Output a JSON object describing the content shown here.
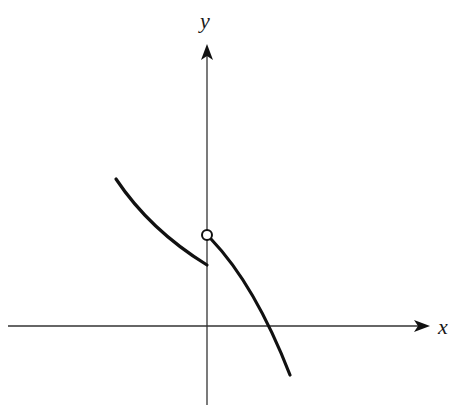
{
  "figure": {
    "type": "piecewise function graph with jump discontinuity",
    "background": "#ffffff",
    "stroke_color": "#111111",
    "axis_color": "#333333"
  },
  "axes": {
    "x_label": "x",
    "y_label": "y",
    "origin_px": [
      207,
      326
    ],
    "x_axis_range_px": [
      8,
      425
    ],
    "y_axis_range_px": [
      405,
      47
    ]
  },
  "curves": {
    "left_branch": {
      "description": "decreasing curve for x < 0, ending with closed endpoint below open circle",
      "start_px": [
        116,
        179
      ],
      "end_px": [
        207,
        265
      ]
    },
    "right_branch": {
      "description": "decreasing concave-down curve for x > 0, starting at open circle, crossing x-axis",
      "start_px": [
        212,
        238
      ],
      "x_intercept_px": [
        269,
        326
      ],
      "end_px": [
        290,
        375
      ]
    },
    "open_circle": {
      "center_px": [
        207,
        235
      ],
      "radius_px": 5
    }
  }
}
